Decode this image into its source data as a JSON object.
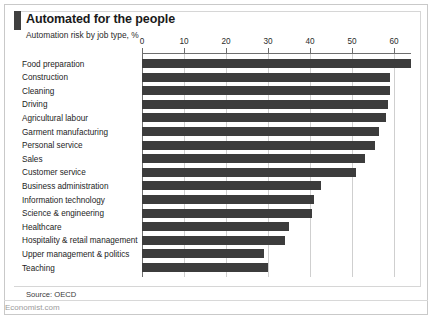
{
  "header": {
    "title": "Automated for the people",
    "subtitle": "Automation risk by job type, %",
    "accent_color": "#404040"
  },
  "footer": {
    "source": "Source: OECD",
    "brand": "Economist.com"
  },
  "chart_data": {
    "type": "bar",
    "orientation": "horizontal",
    "title": "Automated for the people",
    "subtitle": "Automation risk by job type, %",
    "xlabel": "",
    "ylabel": "",
    "xlim": [
      0,
      64
    ],
    "grid": true,
    "legend": null,
    "bar_color": "#3c3c3c",
    "xticks": [
      0,
      10,
      20,
      30,
      40,
      50,
      60
    ],
    "xtick_labels": [
      "0",
      "10",
      "20",
      "30",
      "40",
      "50",
      "60"
    ],
    "categories": [
      "Food preparation",
      "Construction",
      "Cleaning",
      "Driving",
      "Agricultural labour",
      "Garment manufacturing",
      "Personal service",
      "Sales",
      "Customer service",
      "Business administration",
      "Information technology",
      "Science & engineering",
      "Healthcare",
      "Hospitality & retail management",
      "Upper management & politics",
      "Teaching"
    ],
    "values": [
      64,
      59,
      59,
      58.5,
      58,
      56.5,
      55.5,
      53,
      51,
      42.5,
      41,
      40.5,
      35,
      34,
      29,
      30
    ],
    "source": "Source: OECD"
  }
}
